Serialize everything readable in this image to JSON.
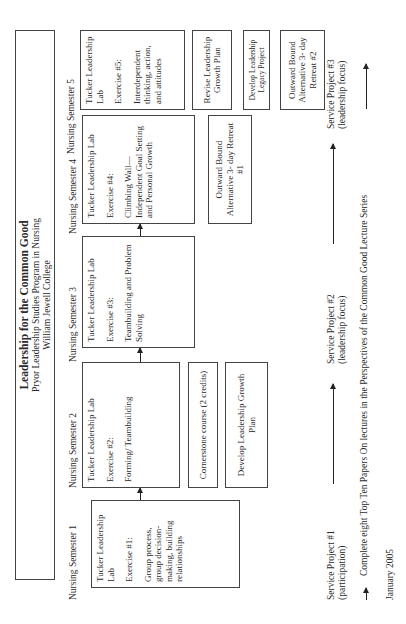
{
  "header": {
    "title": "Leadership for the Common Good",
    "subtitle1": "Pryor Leadership Studies Program in Nursing",
    "subtitle2": "William Jewell College"
  },
  "semesters": [
    {
      "label": "Nursing Semester 1",
      "main": {
        "lab": "Tucker Leadership Lab",
        "exercise": "Exercise #1:",
        "topic": "Group process, group decision-making, building relationships"
      }
    },
    {
      "label": "Nursing Semester 2",
      "main": {
        "lab": "Tucker Leadership Lab",
        "exercise": "Exercise #2:",
        "topic": "Forming/ Teambuilding"
      },
      "extra": [
        "Cornerstone course (2 credits)",
        "Develop Leadership Growth Plan"
      ]
    },
    {
      "label": "Nursing Semester 3",
      "main": {
        "lab": "Tucker Leadership Lab",
        "exercise": "Exercise #3:",
        "topic": "Teambuilding and Problem Solving"
      }
    },
    {
      "label": "Nursing Semester 4",
      "main": {
        "lab": "Tucker Leadership Lab",
        "exercise": "Exercise #4:",
        "topic": "Climbing Wall—Independent Goal Setting and Personal Growth"
      },
      "extra": [
        "Outward Bound Alternative 3- day Retreat #1"
      ]
    },
    {
      "label": "Nursing Semester 5",
      "main": {
        "lab": "Tucker Leadership Lab",
        "exercise": "Exercise #5:",
        "topic": "Interdependent thinking, action, and attitudes"
      },
      "extra": [
        "Revise Leadership Growth Plan",
        "Develop Leadership Legacy Project",
        "Outward Bound Alternative 3- day Retreat #2"
      ]
    }
  ],
  "service_projects": [
    {
      "line1": "Service Project #1",
      "line2": "(participation)"
    },
    {
      "line1": "Service Project #2",
      "line2": "(leadership focus)"
    },
    {
      "line1": "Service Project #3",
      "line2": "(leadership focus)"
    }
  ],
  "footer": {
    "lecture_note": "Complete eight Top Ten Papers On lectures in the Perspectives of the Common Good Lecture Series",
    "date": "January 2005"
  },
  "icons": {
    "arrow": "arrow-right-icon"
  },
  "colors": {
    "line": "#444444",
    "text": "#2a2a2a",
    "background": "#ffffff"
  }
}
